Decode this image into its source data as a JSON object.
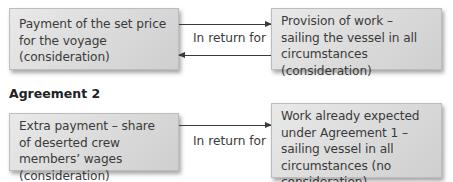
{
  "agreement1": {
    "left_box": "Payment of the set price for the voyage (consideration)",
    "right_box": "Provision of work – sailing the vessel in all circumstances (consideration)",
    "connector_label": "In return for"
  },
  "agreement2": {
    "heading": "Agreement 2",
    "left_box": "Extra payment – share of deserted crew members’ wages (consideration)",
    "right_box": "Work already expected under Agreement 1 – sailing vessel in all circumstances (no consideration)",
    "connector_label": "In return for"
  },
  "colors": {
    "box_fill": "#dcdcdc",
    "text": "#3a3a3a",
    "arrow": "#3a3a3a"
  }
}
